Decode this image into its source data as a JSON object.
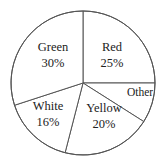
{
  "chart_data": {
    "type": "pie",
    "title": "",
    "categories": [
      "Red",
      "Other",
      "Yellow",
      "White",
      "Green"
    ],
    "values": [
      25,
      9,
      20,
      16,
      30
    ],
    "labels": [
      "25%",
      "",
      "20%",
      "16%",
      "30%"
    ],
    "start_angle": "12 o'clock",
    "direction": "clockwise",
    "legend": "none",
    "colors": {
      "fill": "#ffffff",
      "stroke": "#555555",
      "text": "#222222"
    }
  },
  "labels": {
    "red": {
      "name": "Red",
      "pct": "25%"
    },
    "other": {
      "name": "Other"
    },
    "yellow": {
      "name": "Yellow",
      "pct": "20%"
    },
    "white": {
      "name": "White",
      "pct": "16%"
    },
    "green": {
      "name": "Green",
      "pct": "30%"
    }
  }
}
